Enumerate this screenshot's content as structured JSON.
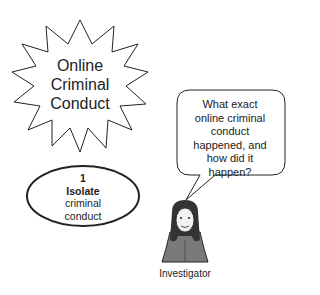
{
  "starburst": {
    "lines": [
      "Online",
      "Criminal",
      "Conduct"
    ]
  },
  "speech_bubble": {
    "lines": [
      "What exact",
      "online criminal",
      "conduct",
      "happened, and",
      "how did it",
      "happen?"
    ]
  },
  "step": {
    "number": "1",
    "title": "Isolate",
    "lines": [
      "criminal",
      "conduct"
    ]
  },
  "investigator": {
    "label": "Investigator",
    "icon": "investigator-figure-icon"
  },
  "colors": {
    "stroke": "#222222",
    "background": "#ffffff",
    "figure_fill": "#7a7a7a"
  }
}
